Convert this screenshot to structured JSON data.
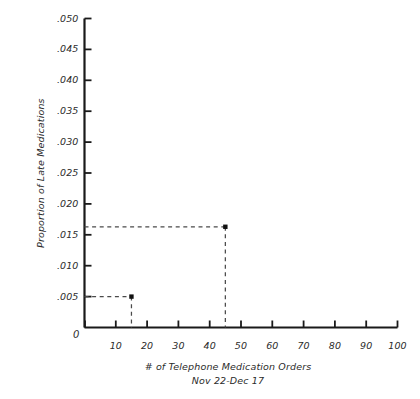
{
  "chart_data": {
    "type": "scatter",
    "title": "",
    "subtitle": "",
    "xlabel": "# of Telephone Medication Orders",
    "xlabel_line2": "Nov 22-Dec 17",
    "ylabel": "Proportion of Late Medications",
    "xlim": [
      0,
      100
    ],
    "ylim": [
      0,
      0.05
    ],
    "grid": false,
    "legend": "none",
    "x_ticks": [
      0,
      10,
      20,
      30,
      40,
      50,
      60,
      70,
      80,
      90,
      100
    ],
    "x_tick_labels": [
      "0",
      "10",
      "20",
      "30",
      "40",
      "50",
      "60",
      "70",
      "80",
      "90",
      "100"
    ],
    "y_ticks": [
      0.005,
      0.01,
      0.015,
      0.02,
      0.025,
      0.03,
      0.035,
      0.04,
      0.045,
      0.05
    ],
    "y_tick_labels": [
      ".005",
      ".010",
      ".015",
      ".020",
      ".025",
      ".030",
      ".035",
      ".040",
      ".045",
      ".050"
    ],
    "x": [
      15,
      45
    ],
    "values": [
      0.005,
      0.0163
    ],
    "points": [
      {
        "label": "point-1",
        "x": 15,
        "y": 0.005
      },
      {
        "label": "point-2",
        "x": 45,
        "y": 0.0163
      }
    ],
    "annotations": [
      "dashed leader from y-axis to point-1 at y=.005",
      "dashed drop from point-1 down to x-axis at x=15",
      "dashed leader from y-axis to point-2 at y=.0163",
      "dashed drop from point-2 down to x-axis at x=45"
    ],
    "colors": {
      "axis": "#1a1a1a",
      "marker": "#111111",
      "leader": "#4a4a4a",
      "text": "#2b2b2b",
      "background": "#ffffff"
    }
  }
}
